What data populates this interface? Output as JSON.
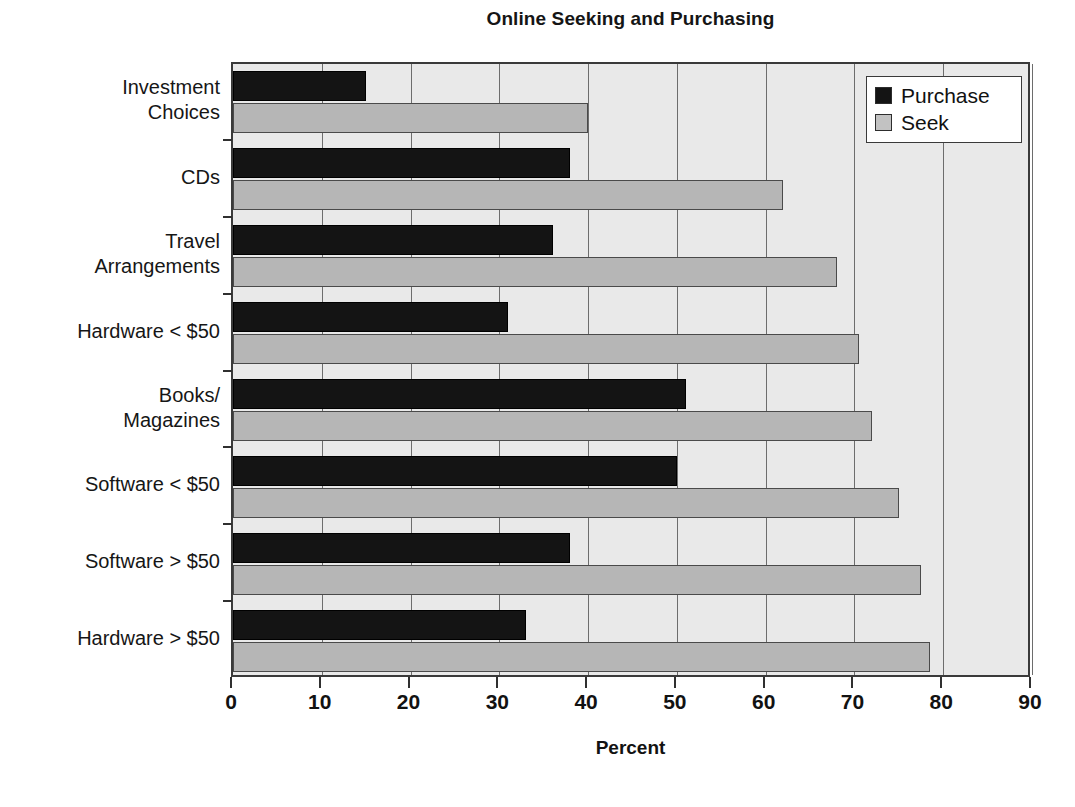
{
  "chart_data": {
    "type": "bar",
    "orientation": "horizontal",
    "title": "Online Seeking and Purchasing",
    "xlabel": "Percent",
    "ylabel": "",
    "xlim": [
      0,
      90
    ],
    "xticks": [
      0,
      10,
      20,
      30,
      40,
      50,
      60,
      70,
      80,
      90
    ],
    "grid": true,
    "grid_axis": "x",
    "legend_position": "top-right",
    "categories": [
      "Investment\nChoices",
      "CDs",
      "Travel\nArrangements",
      "Hardware < $50",
      "Books/\nMagazines",
      "Software < $50",
      "Software > $50",
      "Hardware > $50"
    ],
    "series": [
      {
        "name": "Purchase",
        "color": "#141414",
        "values": [
          15,
          38,
          36,
          31,
          51,
          50,
          38,
          33
        ]
      },
      {
        "name": "Seek",
        "color": "#b6b6b6",
        "values": [
          40,
          62,
          68,
          70.5,
          72,
          75,
          77.5,
          78.5
        ]
      }
    ]
  },
  "legend": {
    "items": [
      {
        "label": "Purchase",
        "swatch": "purchase"
      },
      {
        "label": "Seek",
        "swatch": "seek"
      }
    ]
  },
  "axis": {
    "x_tick_labels": [
      "0",
      "10",
      "20",
      "30",
      "40",
      "50",
      "60",
      "70",
      "80",
      "90"
    ],
    "x_title": "Percent"
  },
  "artifact": {
    "text": ""
  }
}
